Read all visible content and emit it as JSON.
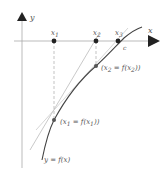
{
  "diagram": {
    "type": "newton-method-illustration",
    "axes": {
      "x_label": "x",
      "y_label": "y"
    },
    "points_on_axis": [
      {
        "label": "x",
        "sub": "1"
      },
      {
        "label": "x",
        "sub": "2"
      },
      {
        "label": "x",
        "sub": "3"
      }
    ],
    "root_label": "c",
    "curve_label": "y = f(x)",
    "curve_points": [
      {
        "open": "(x",
        "sub1": "1",
        "mid": " = f(x",
        "sub2": "1",
        "close": "))"
      },
      {
        "open": "(x",
        "sub1": "2",
        "mid": " = f(x",
        "sub2": "2",
        "close": "))"
      }
    ],
    "colors": {
      "axis": "#aaaaaa",
      "curve": "#444444",
      "tangent": "#bbbbbb",
      "dashed": "#aaaaaa",
      "point": "#222222",
      "text": "#555555"
    }
  }
}
